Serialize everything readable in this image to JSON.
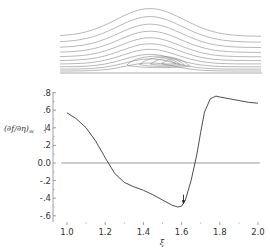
{
  "chart_data": [
    {
      "type": "contour",
      "title": "",
      "description": "Streamline pattern over a bump with a closed recirculation bubble near the wall",
      "n_streamlines_open": 10,
      "n_streamlines_closed": 4,
      "x_range_px": [
        60,
        262
      ],
      "bubble_center_px": [
        172,
        62
      ]
    },
    {
      "type": "line",
      "title": "",
      "xlabel": "ξ",
      "ylabel": "(∂f/∂η)|w",
      "xlim": [
        0.97,
        2.03
      ],
      "ylim": [
        -0.6,
        0.8
      ],
      "x_ticks": [
        "1.0",
        "1.2",
        "1.4",
        "1.6",
        "1.8",
        "2.0"
      ],
      "y_ticks": [
        ".8",
        ".6",
        ".4",
        ".2",
        "0.0",
        "-.2",
        "-.4",
        "-.6"
      ],
      "grid": false,
      "legend": null,
      "series": [
        {
          "name": "wall shear",
          "x": [
            1.0,
            1.05,
            1.1,
            1.15,
            1.2,
            1.25,
            1.3,
            1.35,
            1.4,
            1.45,
            1.5,
            1.55,
            1.58,
            1.6,
            1.62,
            1.65,
            1.68,
            1.7,
            1.72,
            1.75,
            1.78,
            1.8,
            1.85,
            1.9,
            1.95,
            2.0
          ],
          "values": [
            0.57,
            0.5,
            0.4,
            0.25,
            0.06,
            -0.12,
            -0.22,
            -0.27,
            -0.31,
            -0.36,
            -0.42,
            -0.48,
            -0.5,
            -0.49,
            -0.42,
            -0.2,
            0.1,
            0.35,
            0.58,
            0.73,
            0.76,
            0.75,
            0.73,
            0.71,
            0.69,
            0.68
          ]
        },
        {
          "name": "zero line",
          "x": [
            0.98,
            2.02
          ],
          "values": [
            0.0,
            0.0
          ]
        }
      ],
      "annotations": [
        {
          "type": "arrow",
          "x": 1.61,
          "y_from": -0.36,
          "y_to": -0.47,
          "label": ""
        }
      ]
    }
  ],
  "axis": {
    "xlabel": "ξ",
    "ylabel_main": "(∂f/∂η)",
    "ylabel_sub": "w",
    "x_ticks": [
      "1.0",
      "1.2",
      "1.4",
      "1.6",
      "1.8",
      "2.0"
    ],
    "y_ticks": [
      ".8",
      ".6",
      ".4",
      ".2",
      "0.0",
      "-.2",
      "-.4",
      "-.6"
    ]
  },
  "colors": {
    "curve": "#333333",
    "zero_line": "#999999",
    "streamlines": "#888888",
    "axis": "#666666"
  }
}
